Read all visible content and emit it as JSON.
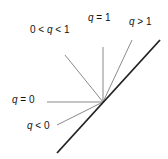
{
  "diagram": {
    "colors": {
      "thin_line": "#8a8a8a",
      "thick_line": "#222222",
      "text": "#111111",
      "background": "#ffffff"
    },
    "origin": {
      "x": 103,
      "y": 102
    },
    "main_line": {
      "x1": 57,
      "y1": 153,
      "x2": 160,
      "y2": 40
    },
    "rays": [
      {
        "id": "q-less-0",
        "label": "q < 0",
        "x2": 57,
        "y2": 125,
        "label_x": 27,
        "label_y": 129
      },
      {
        "id": "q-equals-0",
        "label": "q = 0",
        "x2": 47,
        "y2": 102,
        "label_x": 12,
        "label_y": 103
      },
      {
        "id": "q-between-0-1",
        "label": "0 < q < 1",
        "x2": 65,
        "y2": 55,
        "label_x": 30,
        "label_y": 33
      },
      {
        "id": "q-equals-1",
        "label": "q = 1",
        "x2": 103,
        "y2": 47,
        "label_x": 88,
        "label_y": 21
      },
      {
        "id": "q-greater-1",
        "label": "q > 1",
        "x2": 132,
        "y2": 40,
        "label_x": 129,
        "label_y": 25
      }
    ]
  }
}
